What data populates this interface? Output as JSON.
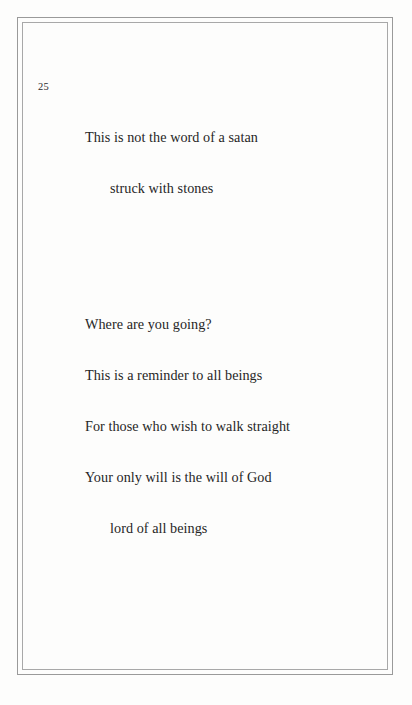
{
  "page": {
    "background_color": "#fdfdfc",
    "text_color": "#262626",
    "frame_color": "#9a9a9a",
    "line_number": "25"
  },
  "poem": {
    "stanzas": [
      {
        "lines": [
          {
            "text": "This is not the word of a satan",
            "indent": false
          },
          {
            "text": "struck with stones",
            "indent": true
          }
        ]
      },
      {
        "lines": [
          {
            "text": "Where are you going?",
            "indent": false
          },
          {
            "text": "This is a reminder to all beings",
            "indent": false
          },
          {
            "text": "For those who wish to walk straight",
            "indent": false
          },
          {
            "text": "Your only will is the will of God",
            "indent": false
          },
          {
            "text": "lord of all beings",
            "indent": true
          }
        ]
      }
    ]
  }
}
